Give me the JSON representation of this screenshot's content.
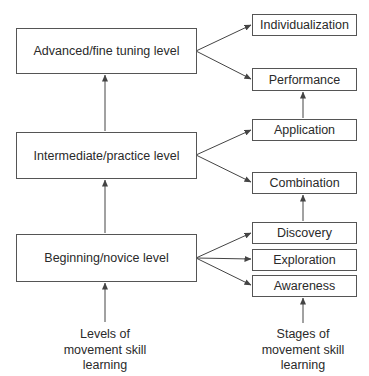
{
  "levels": {
    "advanced": "Advanced/fine tuning level",
    "intermediate": "Intermediate/practice level",
    "beginning": "Beginning/novice level"
  },
  "stages": {
    "individualization": "Individualization",
    "performance": "Performance",
    "application": "Application",
    "combination": "Combination",
    "discovery": "Discovery",
    "exploration": "Exploration",
    "awareness": "Awareness"
  },
  "captions": {
    "levels": [
      "Levels of",
      "movement skill",
      "learning"
    ],
    "stages": [
      "Stages of",
      "movement skill",
      "learning"
    ]
  },
  "colors": {
    "line": "#444444",
    "border": "#555555",
    "text": "#2a2a2a"
  }
}
